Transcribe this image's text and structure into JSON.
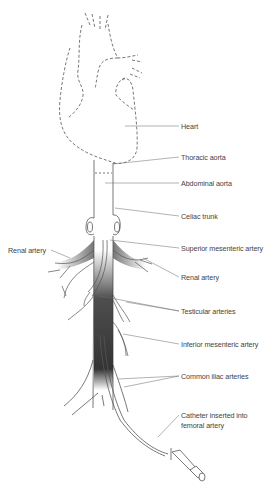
{
  "labels": {
    "heart": "Heart",
    "thoracic_aorta": "Thoracic aorta",
    "abdominal_aorta": "Abdominal aorta",
    "celiac_trunk": "Celiac trunk",
    "renal_artery_left": "Renal artery",
    "superior_mesenteric": "Superior mesenteric artery",
    "renal_artery_right": "Renal artery",
    "testicular_arteries": "Testicular arteries",
    "inferior_mesenteric": "Inferior mesenteric artery",
    "common_iliac": "Common iliac arteries",
    "catheter_line1": "Catheter inserted into",
    "catheter_line2": "femoral artery"
  },
  "colors": {
    "line": "#555555",
    "contrast_dye": "#3a3a3a",
    "label_text": "#444444"
  }
}
